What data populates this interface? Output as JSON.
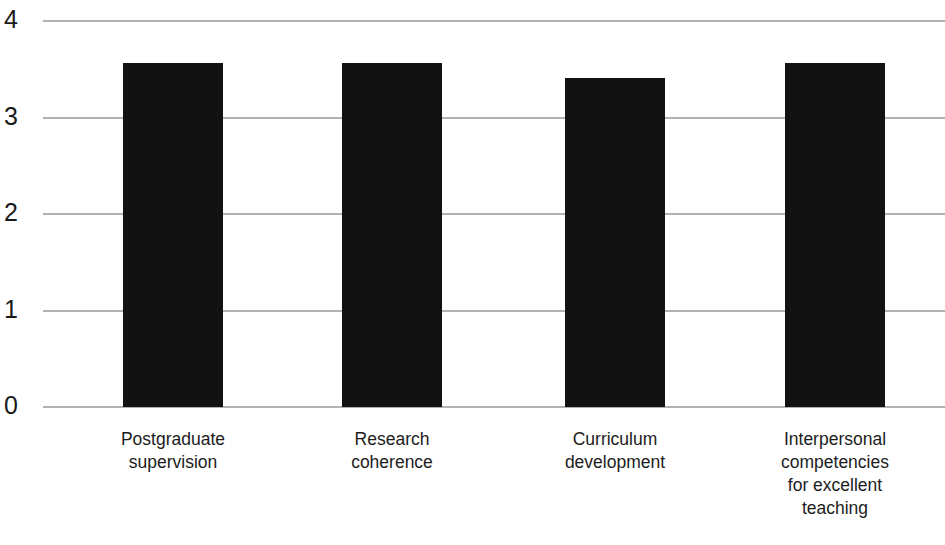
{
  "chart_data": {
    "type": "bar",
    "title": "",
    "subtitle": "",
    "xlabel": "",
    "ylabel": "",
    "ylim": [
      0,
      4
    ],
    "yticks": [
      0,
      1,
      2,
      3,
      4
    ],
    "ytick_labels": [
      "0",
      "1",
      "2",
      "3",
      "4"
    ],
    "grid": true,
    "legend": false,
    "bar_color": "#121212",
    "grid_color": "#b2b2b2",
    "categories": [
      "Postgraduate supervision",
      "Research coherence",
      "Curriculum development",
      "Interpersonal competencies for excellent teaching"
    ],
    "category_lines": [
      [
        "Postgraduate",
        "supervision"
      ],
      [
        "Research",
        "coherence"
      ],
      [
        "Curriculum",
        "development"
      ],
      [
        "Interpersonal",
        "competencies",
        "for excellent",
        "teaching"
      ]
    ],
    "values": [
      3.56,
      3.56,
      3.41,
      3.56
    ],
    "series": [
      {
        "name": "",
        "values": [
          3.56,
          3.56,
          3.41,
          3.56
        ]
      }
    ]
  }
}
